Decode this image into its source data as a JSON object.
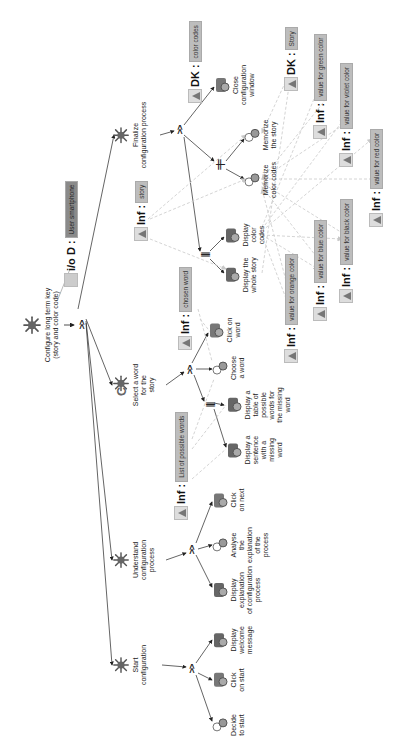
{
  "diagram": {
    "root": {
      "label": "Configure long term key\n(story and color code)",
      "operator": ">>"
    },
    "root_device": {
      "kind": "i/o D :",
      "value": "User smartphone"
    },
    "tasks": {
      "start": {
        "label": "Start\nconfiguration",
        "operator": ">>"
      },
      "understand": {
        "label": "Understand\nconfiguration\nprocess",
        "operator": ">>"
      },
      "select": {
        "label": "Select a word\nfor the\nstory",
        "operator": ">>"
      },
      "finalize": {
        "label": "Finalize\nconfiguration process",
        "operator": ">>"
      }
    },
    "leaves": {
      "decide_start": "Decide\nto start",
      "click_start": "Click\non start",
      "display_welcome": "Display\nwelcome\nmessage",
      "display_explanation": "Display\nexplanation\nof configuration\nprocess",
      "analyse": "Analyse\nthe\nexplanation\nof the\nprocess",
      "click_next": "Click\non next",
      "display_sentence": "Display a\nsentence\nwith a\nmissing\nword",
      "display_table": "Display a\ntable of\npossible\nwords for\nthe missing\nword",
      "choose_word": "Choose\na word",
      "click_word": "Click on\nword",
      "display_story": "Display the\nwhole story",
      "display_colors": "Display\ncolor\ncodes",
      "memorize_colors": "Memorize\ncolor codes",
      "memorize_story": "Memorize\nthe story",
      "close_window": "Close\nconfiguration\nwindow"
    },
    "operators": {
      "select_concurrent": "|||",
      "finalize_concurrent": "|||",
      "finalize_order": "=|="
    },
    "data": {
      "inf_possible_words": {
        "kind": "Inf :",
        "value": "List of possible words"
      },
      "inf_chosen_word": {
        "kind": "Inf :",
        "value": "chosen word"
      },
      "inf_story": {
        "kind": "Inf :",
        "value": "story"
      },
      "dk_color_codes": {
        "kind": "DK :",
        "value": "color codes"
      },
      "dk_story": {
        "kind": "DK :",
        "value": "Story"
      },
      "inf_green": {
        "kind": "Inf :",
        "value": "value for green color"
      },
      "inf_violet": {
        "kind": "Inf :",
        "value": "value for violet color"
      },
      "inf_red": {
        "kind": "Inf :",
        "value": "value for red color"
      },
      "inf_black": {
        "kind": "Inf :",
        "value": "value for black color"
      },
      "inf_blue": {
        "kind": "Inf :",
        "value": "value for blue color"
      },
      "inf_orange": {
        "kind": "Inf :",
        "value": "value for orange color"
      }
    }
  }
}
